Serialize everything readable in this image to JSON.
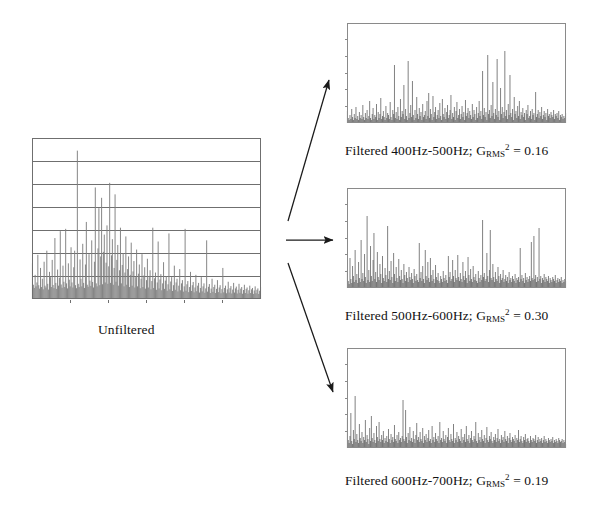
{
  "figure": {
    "background_color": "#ffffff"
  },
  "panels": {
    "unfiltered": {
      "label": "Unfiltered",
      "frame_color": "#6f6f6f",
      "trace_color": "#808080",
      "gridlines": 6,
      "has_grid": true
    },
    "filtered": [
      {
        "id": "filtered-400-500",
        "caption_prefix": "Filtered 400Hz-500Hz; G",
        "caption_sub": "RMS",
        "caption_sup": "2",
        "caption_value": "= 0.16",
        "band_low_hz": 400,
        "band_high_hz": 500,
        "grms_squared": 0.16,
        "frame_color": "#8a8a8a",
        "trace_color": "#4f4f4f"
      },
      {
        "id": "filtered-500-600",
        "caption_prefix": "Filtered 500Hz-600Hz; G",
        "caption_sub": "RMS",
        "caption_sup": "2",
        "caption_value": "= 0.30",
        "band_low_hz": 500,
        "band_high_hz": 600,
        "grms_squared": 0.3,
        "frame_color": "#8a8a8a",
        "trace_color": "#4f4f4f"
      },
      {
        "id": "filtered-600-700",
        "caption_prefix": "Filtered 600Hz-700Hz; G",
        "caption_sub": "RMS",
        "caption_sup": "2",
        "caption_value": "= 0.19",
        "band_low_hz": 600,
        "band_high_hz": 700,
        "grms_squared": 0.19,
        "frame_color": "#8a8a8a",
        "trace_color": "#4f4f4f"
      }
    ]
  },
  "arrows": [
    {
      "id": "arrow-to-top",
      "direction": "up-right",
      "color": "#1a1a1a"
    },
    {
      "id": "arrow-to-middle",
      "direction": "right",
      "color": "#1a1a1a"
    },
    {
      "id": "arrow-to-bottom",
      "direction": "down-right",
      "color": "#1a1a1a"
    }
  ],
  "chart_data": {
    "type": "line",
    "xlabel": "",
    "ylabel": "",
    "grid": "horizontal gridlines on unfiltered panel only",
    "legend": "none",
    "charts": [
      {
        "name": "Unfiltered",
        "type": "line",
        "ylim": [
          0,
          7
        ],
        "xlim": [
          0,
          256
        ],
        "gridline_values": [
          1,
          2,
          3,
          4,
          5,
          6
        ],
        "values": [
          1.55,
          0.62,
          0.48,
          1.05,
          0.55,
          0.72,
          1.92,
          0.6,
          0.45,
          1.35,
          0.52,
          0.88,
          0.42,
          1.62,
          0.58,
          0.5,
          2.1,
          0.66,
          0.41,
          1.18,
          0.95,
          0.52,
          1.7,
          0.61,
          0.47,
          2.65,
          0.7,
          0.44,
          1.28,
          0.58,
          0.92,
          2.95,
          0.63,
          0.49,
          1.45,
          0.75,
          0.52,
          3.05,
          0.68,
          0.46,
          1.55,
          0.84,
          0.55,
          2.25,
          0.72,
          0.5,
          1.38,
          2.1,
          0.6,
          0.47,
          6.45,
          0.66,
          0.52,
          1.72,
          0.88,
          0.55,
          2.4,
          0.7,
          0.48,
          1.5,
          3.35,
          0.62,
          0.53,
          1.95,
          0.8,
          0.57,
          2.55,
          0.74,
          0.5,
          1.62,
          4.85,
          0.68,
          0.55,
          2.2,
          3.95,
          0.6,
          1.85,
          4.4,
          0.64,
          2.05,
          2.8,
          0.72,
          1.58,
          3.2,
          0.66,
          1.42,
          5.05,
          0.7,
          1.9,
          2.6,
          0.62,
          1.35,
          4.55,
          0.75,
          1.7,
          2.35,
          0.58,
          1.25,
          3.1,
          0.68,
          1.48,
          2.0,
          0.55,
          1.15,
          2.72,
          0.62,
          1.3,
          1.85,
          0.52,
          1.05,
          2.45,
          0.58,
          1.2,
          1.65,
          0.5,
          0.95,
          2.15,
          0.55,
          1.1,
          1.5,
          0.47,
          0.88,
          1.95,
          0.52,
          1.02,
          1.38,
          0.45,
          0.82,
          1.75,
          0.5,
          0.95,
          1.25,
          0.42,
          0.78,
          3.1,
          0.48,
          0.9,
          1.15,
          0.4,
          0.72,
          2.5,
          0.46,
          0.85,
          1.08,
          0.38,
          0.68,
          1.6,
          0.44,
          0.8,
          1.0,
          0.36,
          0.64,
          2.85,
          0.42,
          0.76,
          0.95,
          0.35,
          0.6,
          1.45,
          0.4,
          0.72,
          0.88,
          0.33,
          0.58,
          1.3,
          0.38,
          0.68,
          0.82,
          0.32,
          0.55,
          3.05,
          0.36,
          0.64,
          0.78,
          0.3,
          0.52,
          1.18,
          0.35,
          0.6,
          0.74,
          0.29,
          0.5,
          1.05,
          0.34,
          0.58,
          0.7,
          0.28,
          0.48,
          0.95,
          0.33,
          0.55,
          0.68,
          0.27,
          0.46,
          2.55,
          0.32,
          0.53,
          0.65,
          0.26,
          0.45,
          0.88,
          0.31,
          0.52,
          0.62,
          0.26,
          0.44,
          0.82,
          0.3,
          0.5,
          0.6,
          0.25,
          0.43,
          1.35,
          0.29,
          0.48,
          0.58,
          0.25,
          0.42,
          0.75,
          0.28,
          0.47,
          0.56,
          0.24,
          0.41,
          0.7,
          0.28,
          0.46,
          0.54,
          0.24,
          0.4,
          0.66,
          0.27,
          0.45,
          0.52,
          0.23,
          0.39,
          0.62,
          0.26,
          0.44,
          0.5,
          0.23,
          0.38,
          0.58,
          0.26,
          0.42,
          0.48,
          0.22,
          0.37,
          0.55,
          0.25,
          0.4,
          0.46,
          0.22,
          0.36,
          0.52
        ]
      },
      {
        "name": "Filtered 400Hz-500Hz",
        "type": "line",
        "ylim": [
          0,
          1
        ],
        "xlim": [
          0,
          256
        ],
        "grms_squared": 0.16,
        "values": [
          0.12,
          0.05,
          0.03,
          0.08,
          0.04,
          0.14,
          0.06,
          0.03,
          0.09,
          0.05,
          0.16,
          0.04,
          0.07,
          0.03,
          0.11,
          0.05,
          0.08,
          0.04,
          0.18,
          0.06,
          0.03,
          0.1,
          0.05,
          0.13,
          0.04,
          0.07,
          0.22,
          0.05,
          0.03,
          0.09,
          0.15,
          0.04,
          0.08,
          0.06,
          0.19,
          0.03,
          0.11,
          0.05,
          0.09,
          0.25,
          0.04,
          0.07,
          0.12,
          0.06,
          0.03,
          0.17,
          0.05,
          0.1,
          0.08,
          0.04,
          0.21,
          0.06,
          0.03,
          0.13,
          0.09,
          0.58,
          0.05,
          0.11,
          0.04,
          0.16,
          0.07,
          0.03,
          0.24,
          0.06,
          0.12,
          0.09,
          0.38,
          0.04,
          0.14,
          0.07,
          0.03,
          0.62,
          0.05,
          0.1,
          0.18,
          0.06,
          0.42,
          0.08,
          0.03,
          0.13,
          0.05,
          0.26,
          0.09,
          0.04,
          0.15,
          0.07,
          0.11,
          0.03,
          0.19,
          0.06,
          0.08,
          0.12,
          0.04,
          0.22,
          0.07,
          0.3,
          0.05,
          0.14,
          0.09,
          0.03,
          0.27,
          0.06,
          0.11,
          0.16,
          0.04,
          0.08,
          0.13,
          0.05,
          0.2,
          0.07,
          0.03,
          0.24,
          0.09,
          0.06,
          0.15,
          0.04,
          0.11,
          0.18,
          0.05,
          0.08,
          0.13,
          0.28,
          0.04,
          0.1,
          0.06,
          0.16,
          0.03,
          0.12,
          0.21,
          0.05,
          0.08,
          0.14,
          0.04,
          0.09,
          0.17,
          0.06,
          0.11,
          0.03,
          0.23,
          0.07,
          0.1,
          0.15,
          0.05,
          0.12,
          0.08,
          0.04,
          0.19,
          0.06,
          0.13,
          0.09,
          0.03,
          0.16,
          0.05,
          0.1,
          0.22,
          0.07,
          0.12,
          0.04,
          0.52,
          0.08,
          0.15,
          0.06,
          0.11,
          0.03,
          0.68,
          0.09,
          0.13,
          0.05,
          0.18,
          0.07,
          0.41,
          0.1,
          0.04,
          0.14,
          0.08,
          0.64,
          0.06,
          0.12,
          0.03,
          0.35,
          0.09,
          0.16,
          0.05,
          0.11,
          0.72,
          0.07,
          0.13,
          0.04,
          0.19,
          0.08,
          0.48,
          0.1,
          0.06,
          0.14,
          0.03,
          0.26,
          0.09,
          0.12,
          0.05,
          0.17,
          0.07,
          0.22,
          0.04,
          0.11,
          0.08,
          0.15,
          0.06,
          0.1,
          0.03,
          0.13,
          0.09,
          0.18,
          0.05,
          0.07,
          0.12,
          0.04,
          0.14,
          0.08,
          0.1,
          0.03,
          0.31,
          0.06,
          0.09,
          0.13,
          0.05,
          0.11,
          0.07,
          0.16,
          0.04,
          0.08,
          0.12,
          0.06,
          0.1,
          0.03,
          0.14,
          0.07,
          0.09,
          0.05,
          0.11,
          0.08,
          0.06,
          0.13,
          0.04,
          0.09,
          0.07,
          0.1,
          0.05,
          0.12,
          0.03,
          0.08,
          0.06,
          0.09,
          0.04,
          0.07,
          0.05,
          0.1
        ]
      },
      {
        "name": "Filtered 500Hz-600Hz",
        "type": "line",
        "ylim": [
          0,
          1
        ],
        "xlim": [
          0,
          256
        ],
        "grms_squared": 0.3,
        "values": [
          0.18,
          0.07,
          0.04,
          0.3,
          0.09,
          0.05,
          0.22,
          0.12,
          0.06,
          0.38,
          0.08,
          0.14,
          0.05,
          0.26,
          0.1,
          0.06,
          0.48,
          0.09,
          0.15,
          0.07,
          0.34,
          0.11,
          0.05,
          0.72,
          0.08,
          0.18,
          0.06,
          0.42,
          0.12,
          0.07,
          0.28,
          0.55,
          0.09,
          0.16,
          0.06,
          0.36,
          0.11,
          0.08,
          0.24,
          0.14,
          0.05,
          0.32,
          0.1,
          0.07,
          0.2,
          0.13,
          0.06,
          0.62,
          0.09,
          0.17,
          0.08,
          0.27,
          0.11,
          0.05,
          0.35,
          0.14,
          0.07,
          0.21,
          0.1,
          0.06,
          0.29,
          0.12,
          0.08,
          0.18,
          0.09,
          0.05,
          0.24,
          0.13,
          0.07,
          0.16,
          0.1,
          0.06,
          0.21,
          0.11,
          0.08,
          0.15,
          0.09,
          0.05,
          0.19,
          0.12,
          0.07,
          0.14,
          0.08,
          0.06,
          0.45,
          0.1,
          0.16,
          0.07,
          0.22,
          0.09,
          0.05,
          0.38,
          0.12,
          0.08,
          0.26,
          0.1,
          0.06,
          0.3,
          0.13,
          0.07,
          0.18,
          0.09,
          0.05,
          0.23,
          0.11,
          0.08,
          0.15,
          0.07,
          0.05,
          0.12,
          0.09,
          0.06,
          0.17,
          0.1,
          0.07,
          0.13,
          0.08,
          0.05,
          0.32,
          0.11,
          0.16,
          0.07,
          0.09,
          0.28,
          0.12,
          0.06,
          0.18,
          0.1,
          0.08,
          0.33,
          0.11,
          0.07,
          0.15,
          0.09,
          0.06,
          0.26,
          0.12,
          0.08,
          0.17,
          0.1,
          0.05,
          0.31,
          0.13,
          0.07,
          0.19,
          0.09,
          0.06,
          0.22,
          0.11,
          0.08,
          0.14,
          0.07,
          0.05,
          0.17,
          0.1,
          0.06,
          0.13,
          0.08,
          0.68,
          0.11,
          0.15,
          0.07,
          0.09,
          0.35,
          0.12,
          0.06,
          0.18,
          0.58,
          0.1,
          0.08,
          0.24,
          0.11,
          0.06,
          0.16,
          0.09,
          0.07,
          0.21,
          0.12,
          0.05,
          0.14,
          0.08,
          0.1,
          0.18,
          0.06,
          0.09,
          0.13,
          0.07,
          0.11,
          0.05,
          0.16,
          0.08,
          0.1,
          0.06,
          0.12,
          0.09,
          0.07,
          0.14,
          0.05,
          0.1,
          0.08,
          0.11,
          0.06,
          0.4,
          0.09,
          0.13,
          0.07,
          0.1,
          0.05,
          0.15,
          0.08,
          0.11,
          0.06,
          0.09,
          0.12,
          0.07,
          0.46,
          0.1,
          0.08,
          0.52,
          0.09,
          0.13,
          0.06,
          0.11,
          0.07,
          0.6,
          0.09,
          0.12,
          0.05,
          0.1,
          0.08,
          0.14,
          0.06,
          0.11,
          0.09,
          0.07,
          0.12,
          0.05,
          0.1,
          0.08,
          0.06,
          0.11,
          0.09,
          0.07,
          0.13,
          0.05,
          0.08,
          0.1,
          0.06,
          0.09,
          0.07,
          0.11,
          0.05,
          0.08,
          0.06,
          0.09,
          0.07
        ]
      },
      {
        "name": "Filtered 600Hz-700Hz",
        "type": "line",
        "ylim": [
          0,
          1
        ],
        "xlim": [
          0,
          256
        ],
        "grms_squared": 0.19,
        "values": [
          0.3,
          0.08,
          0.05,
          0.12,
          0.35,
          0.07,
          0.04,
          0.18,
          0.09,
          0.52,
          0.06,
          0.14,
          0.08,
          0.05,
          0.24,
          0.1,
          0.07,
          0.16,
          0.05,
          0.11,
          0.08,
          0.28,
          0.06,
          0.13,
          0.09,
          0.04,
          0.2,
          0.07,
          0.32,
          0.1,
          0.06,
          0.15,
          0.08,
          0.05,
          0.22,
          0.11,
          0.07,
          0.26,
          0.09,
          0.06,
          0.13,
          0.08,
          0.17,
          0.05,
          0.1,
          0.07,
          0.12,
          0.06,
          0.19,
          0.09,
          0.05,
          0.14,
          0.08,
          0.11,
          0.06,
          0.23,
          0.09,
          0.07,
          0.13,
          0.05,
          0.16,
          0.08,
          0.1,
          0.06,
          0.12,
          0.48,
          0.09,
          0.07,
          0.38,
          0.11,
          0.05,
          0.15,
          0.08,
          0.21,
          0.07,
          0.1,
          0.06,
          0.17,
          0.09,
          0.05,
          0.13,
          0.25,
          0.08,
          0.11,
          0.06,
          0.16,
          0.09,
          0.07,
          0.2,
          0.05,
          0.12,
          0.08,
          0.14,
          0.06,
          0.1,
          0.18,
          0.07,
          0.09,
          0.05,
          0.22,
          0.08,
          0.11,
          0.06,
          0.15,
          0.09,
          0.07,
          0.12,
          0.05,
          0.26,
          0.08,
          0.1,
          0.06,
          0.17,
          0.09,
          0.07,
          0.13,
          0.05,
          0.11,
          0.2,
          0.08,
          0.06,
          0.14,
          0.09,
          0.07,
          0.24,
          0.05,
          0.1,
          0.08,
          0.16,
          0.06,
          0.12,
          0.09,
          0.07,
          0.19,
          0.05,
          0.11,
          0.08,
          0.14,
          0.06,
          0.22,
          0.09,
          0.07,
          0.13,
          0.05,
          0.1,
          0.17,
          0.08,
          0.06,
          0.12,
          0.09,
          0.26,
          0.07,
          0.05,
          0.15,
          0.08,
          0.11,
          0.06,
          0.18,
          0.09,
          0.07,
          0.13,
          0.05,
          0.1,
          0.21,
          0.08,
          0.06,
          0.12,
          0.09,
          0.16,
          0.07,
          0.05,
          0.11,
          0.08,
          0.14,
          0.06,
          0.1,
          0.19,
          0.07,
          0.09,
          0.05,
          0.13,
          0.08,
          0.11,
          0.06,
          0.17,
          0.09,
          0.07,
          0.12,
          0.05,
          0.1,
          0.15,
          0.08,
          0.06,
          0.11,
          0.09,
          0.07,
          0.13,
          0.05,
          0.1,
          0.08,
          0.18,
          0.06,
          0.09,
          0.12,
          0.07,
          0.05,
          0.11,
          0.08,
          0.14,
          0.06,
          0.09,
          0.1,
          0.07,
          0.05,
          0.12,
          0.08,
          0.06,
          0.1,
          0.09,
          0.07,
          0.13,
          0.05,
          0.08,
          0.11,
          0.06,
          0.09,
          0.07,
          0.1,
          0.05,
          0.08,
          0.12,
          0.06,
          0.09,
          0.07,
          0.05,
          0.1,
          0.08,
          0.06,
          0.09,
          0.07,
          0.11,
          0.05,
          0.08,
          0.06,
          0.09,
          0.07,
          0.05,
          0.1,
          0.08,
          0.06,
          0.07,
          0.09,
          0.05,
          0.08,
          0.06,
          0.04
        ]
      }
    ]
  }
}
